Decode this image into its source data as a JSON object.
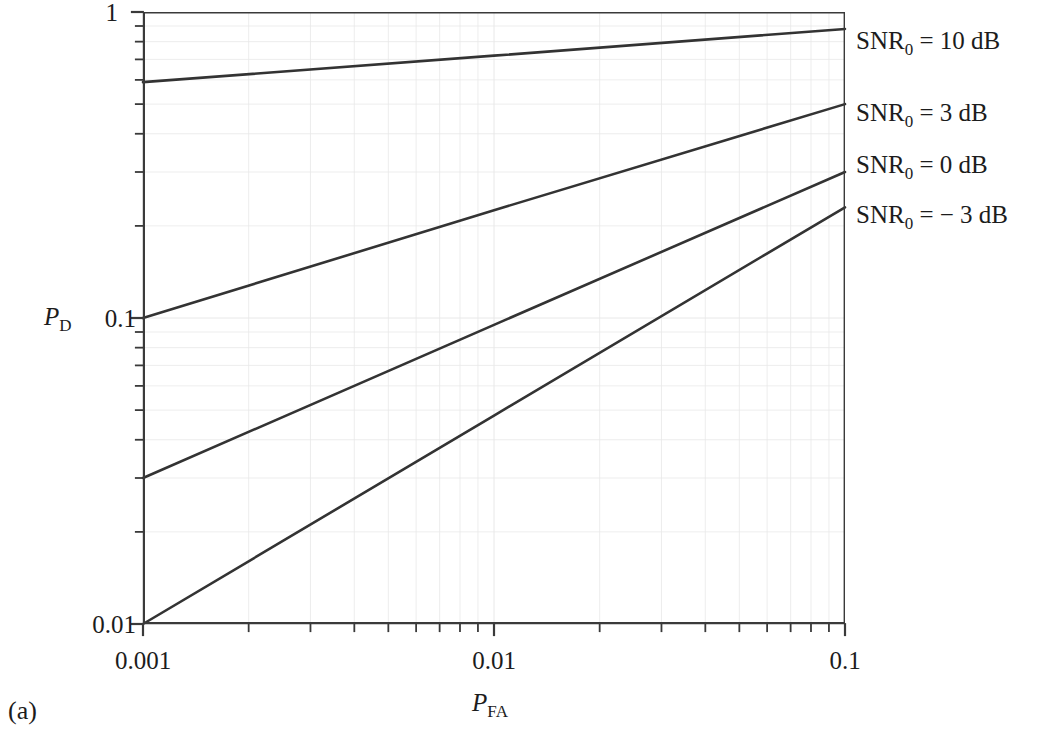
{
  "figure": {
    "caption": "(a)"
  },
  "chart_data": {
    "type": "line",
    "title": "",
    "xlabel": "P_FA",
    "ylabel": "P_D",
    "xlabel_parts": {
      "var": "P",
      "sub": "FA"
    },
    "ylabel_parts": {
      "var": "P",
      "sub": "D"
    },
    "xscale": "log",
    "yscale": "log",
    "xlim": [
      0.001,
      0.1
    ],
    "ylim": [
      0.01,
      1
    ],
    "grid": true,
    "grid_minor": true,
    "legend_position": "right-outside",
    "xticks": [
      0.001,
      0.01,
      0.1
    ],
    "xtick_labels": [
      "0.001",
      "0.01",
      "0.1"
    ],
    "yticks": [
      0.01,
      0.1,
      1
    ],
    "ytick_labels": [
      "0.01",
      "0.1",
      "1"
    ],
    "series": [
      {
        "name": "SNR_0 = 10 dB",
        "label_parts": {
          "var": "SNR",
          "sub": "0",
          "eq": "=",
          "value": "10 dB"
        },
        "x": [
          0.001,
          0.01,
          0.1
        ],
        "y": [
          0.59,
          0.72,
          0.88
        ],
        "color": "#333333"
      },
      {
        "name": "SNR_0 = 3 dB",
        "label_parts": {
          "var": "SNR",
          "sub": "0",
          "eq": "=",
          "value": "3 dB"
        },
        "x": [
          0.001,
          0.01,
          0.1
        ],
        "y": [
          0.1,
          0.225,
          0.5
        ],
        "color": "#333333"
      },
      {
        "name": "SNR_0 = 0 dB",
        "label_parts": {
          "var": "SNR",
          "sub": "0",
          "eq": "=",
          "value": "0 dB"
        },
        "x": [
          0.001,
          0.01,
          0.1
        ],
        "y": [
          0.03,
          0.095,
          0.3
        ],
        "color": "#333333"
      },
      {
        "name": "SNR_0 = -3 dB",
        "label_parts": {
          "var": "SNR",
          "sub": "0",
          "eq": "= −",
          "value": "3 dB"
        },
        "x": [
          0.001,
          0.01,
          0.1
        ],
        "y": [
          0.01,
          0.048,
          0.23
        ],
        "color": "#333333"
      }
    ]
  },
  "legend": {
    "entries": [
      {
        "text": "SNR0 = 10 dB",
        "var": "SNR",
        "sub": "0",
        "rest": " = 10 dB"
      },
      {
        "text": "SNR0 = 3 dB",
        "var": "SNR",
        "sub": "0",
        "rest": " = 3 dB"
      },
      {
        "text": "SNR0 = 0 dB",
        "var": "SNR",
        "sub": "0",
        "rest": " = 0 dB"
      },
      {
        "text": "SNR0 = −3 dB",
        "var": "SNR",
        "sub": "0",
        "rest": " = − 3 dB"
      }
    ]
  },
  "style": {
    "line_color": "#333333",
    "axis_color": "#3a3a3a",
    "grid_color": "#e8e8e8",
    "text_color": "#1c1c1c",
    "background": "#ffffff"
  }
}
